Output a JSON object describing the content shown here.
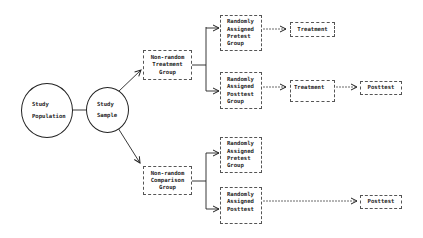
{
  "diagram": {
    "nodes": {
      "population": {
        "lines": [
          "Study",
          "Population"
        ]
      },
      "sample": {
        "lines": [
          "Study",
          "Sample"
        ]
      },
      "treatment_group": {
        "lines": [
          "Non-random",
          "Treatment",
          "Group"
        ]
      },
      "comparison_group": {
        "lines": [
          "Non-random",
          "Comparison",
          "Group"
        ]
      },
      "t_pretest": {
        "lines": [
          "Randomly",
          "Assigned",
          "Pretest",
          "Group"
        ]
      },
      "t_posttest": {
        "lines": [
          "Randomly",
          "Assigned",
          "Posttest",
          "Group"
        ]
      },
      "c_pretest": {
        "lines": [
          "Randomly",
          "Assigned",
          "Pretest",
          "Group"
        ]
      },
      "c_posttest": {
        "lines": [
          "Randomly",
          "Assigned",
          "Posttest"
        ]
      },
      "treatment_1": {
        "lines": [
          "Treatment"
        ]
      },
      "treatment_2": {
        "lines": [
          "Treatment"
        ]
      },
      "posttest_1": {
        "lines": [
          "Posttest"
        ]
      },
      "posttest_2": {
        "lines": [
          "Posttest"
        ]
      }
    },
    "edges": [
      [
        "population",
        "sample"
      ],
      [
        "sample",
        "treatment_group"
      ],
      [
        "sample",
        "comparison_group"
      ],
      [
        "treatment_group",
        "t_pretest"
      ],
      [
        "treatment_group",
        "t_posttest"
      ],
      [
        "comparison_group",
        "c_pretest"
      ],
      [
        "comparison_group",
        "c_posttest"
      ],
      [
        "t_pretest",
        "treatment_1"
      ],
      [
        "t_posttest",
        "treatment_2"
      ],
      [
        "treatment_2",
        "posttest_1"
      ],
      [
        "c_posttest",
        "posttest_2"
      ]
    ]
  }
}
